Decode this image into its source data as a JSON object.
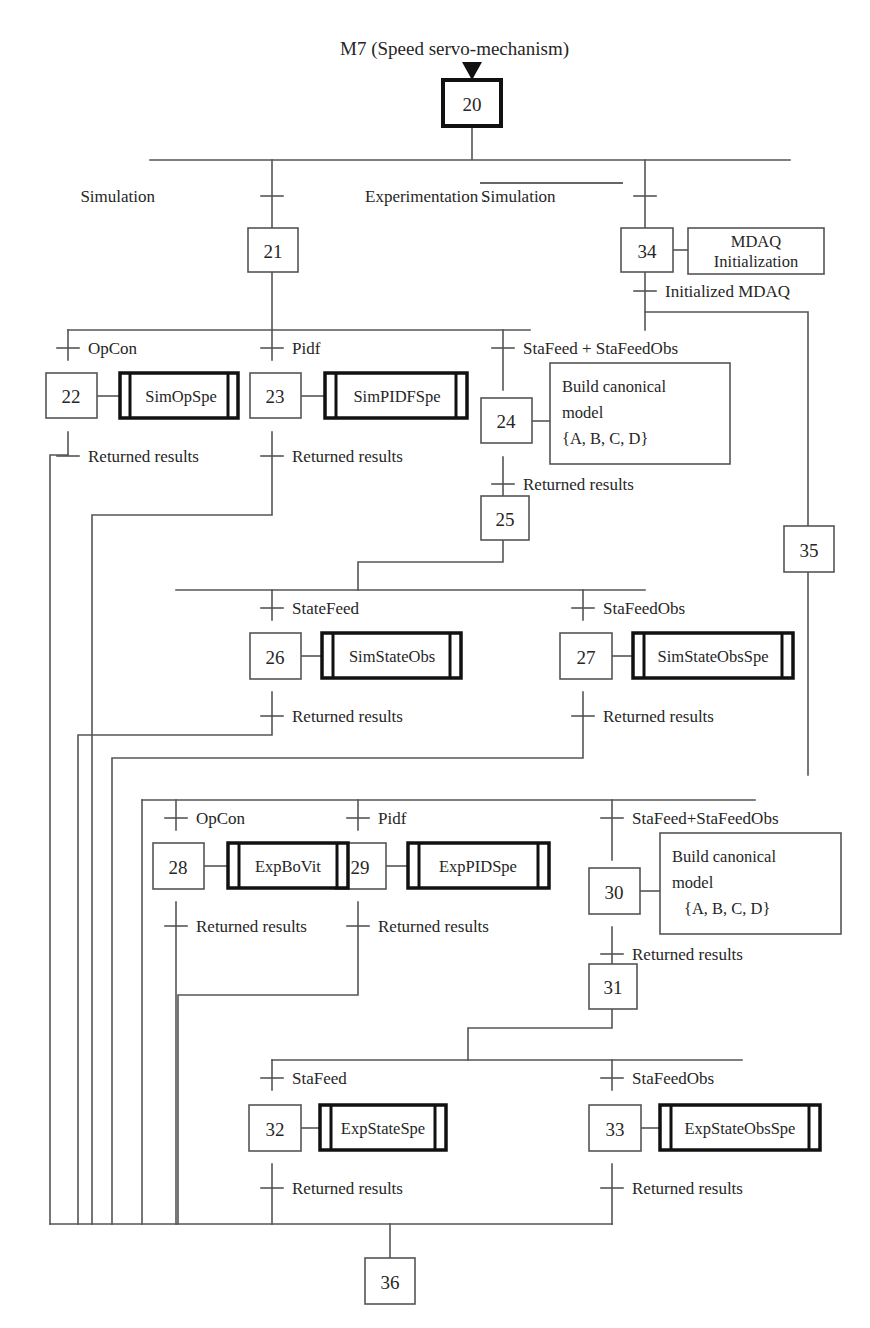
{
  "diagram": {
    "type": "grafcet-sfc",
    "title": "M7 (Speed servo-mechanism)",
    "background": "#ffffff",
    "line_color": "#555555",
    "text_color": "#262626"
  },
  "steps": [
    {
      "id": "20",
      "label": "20",
      "kind": "initial-bold"
    },
    {
      "id": "21",
      "label": "21",
      "kind": "normal"
    },
    {
      "id": "22",
      "label": "22",
      "kind": "normal"
    },
    {
      "id": "23",
      "label": "23",
      "kind": "normal"
    },
    {
      "id": "24",
      "label": "24",
      "kind": "normal"
    },
    {
      "id": "25",
      "label": "25",
      "kind": "normal"
    },
    {
      "id": "26",
      "label": "26",
      "kind": "normal"
    },
    {
      "id": "27",
      "label": "27",
      "kind": "normal"
    },
    {
      "id": "28",
      "label": "28",
      "kind": "normal"
    },
    {
      "id": "29",
      "label": "29",
      "kind": "normal"
    },
    {
      "id": "30",
      "label": "30",
      "kind": "normal"
    },
    {
      "id": "31",
      "label": "31",
      "kind": "normal"
    },
    {
      "id": "32",
      "label": "32",
      "kind": "normal"
    },
    {
      "id": "33",
      "label": "33",
      "kind": "normal"
    },
    {
      "id": "34",
      "label": "34",
      "kind": "normal"
    },
    {
      "id": "35",
      "label": "35",
      "kind": "normal"
    },
    {
      "id": "36",
      "label": "36",
      "kind": "normal"
    }
  ],
  "transitions": [
    {
      "id": "t-simulation",
      "label": "Simulation",
      "overline": false
    },
    {
      "id": "t-experimentation",
      "label": "Experimentation . Simulation",
      "overline": true,
      "overline_part": "Simulation",
      "plain_part": "Experimentation ."
    },
    {
      "id": "t-initialized-mdaq",
      "label": "Initialized MDAQ",
      "overline": false
    },
    {
      "id": "t-opcon-sim",
      "label": "OpCon",
      "overline": false
    },
    {
      "id": "t-pidf-sim",
      "label": "Pidf",
      "overline": false
    },
    {
      "id": "t-stafeed-stafeedobs-sim",
      "label": "StaFeed + StaFeedObs",
      "overline": false
    },
    {
      "id": "t-returned-22",
      "label": "Returned results",
      "overline": false
    },
    {
      "id": "t-returned-23",
      "label": "Returned results",
      "overline": false
    },
    {
      "id": "t-returned-24",
      "label": "Returned results",
      "overline": false
    },
    {
      "id": "t-statefeed-26",
      "label": "StateFeed",
      "overline": false
    },
    {
      "id": "t-stafeedobs-27",
      "label": "StaFeedObs",
      "overline": false
    },
    {
      "id": "t-returned-26",
      "label": "Returned results",
      "overline": false
    },
    {
      "id": "t-returned-27",
      "label": "Returned results",
      "overline": false
    },
    {
      "id": "t-opcon-exp",
      "label": "OpCon",
      "overline": false
    },
    {
      "id": "t-pidf-exp",
      "label": "Pidf",
      "overline": false
    },
    {
      "id": "t-stafeed-stafeedobs-exp",
      "label": "StaFeed+StaFeedObs",
      "overline": false
    },
    {
      "id": "t-returned-28",
      "label": "Returned results",
      "overline": false
    },
    {
      "id": "t-returned-29",
      "label": "Returned results",
      "overline": false
    },
    {
      "id": "t-returned-30",
      "label": "Returned results",
      "overline": false
    },
    {
      "id": "t-stafeed-32",
      "label": "StaFeed",
      "overline": false
    },
    {
      "id": "t-stafeedobs-33",
      "label": "StaFeedObs",
      "overline": false
    },
    {
      "id": "t-returned-32",
      "label": "Returned results",
      "overline": false
    },
    {
      "id": "t-returned-33",
      "label": "Returned results",
      "overline": false
    }
  ],
  "actions": [
    {
      "id": "a-simopspe",
      "label": "SimOpSpe",
      "style": "subroutine",
      "step": "22"
    },
    {
      "id": "a-simpidfspe",
      "label": "SimPIDFSpe",
      "style": "subroutine",
      "step": "23"
    },
    {
      "id": "a-simstateobs",
      "label": "SimStateObs",
      "style": "subroutine",
      "step": "26"
    },
    {
      "id": "a-simstateobsspe",
      "label": "SimStateObsSpe",
      "style": "subroutine",
      "step": "27"
    },
    {
      "id": "a-expbovit",
      "label": "ExpBoVit",
      "style": "subroutine",
      "step": "28"
    },
    {
      "id": "a-exppidspe",
      "label": "ExpPIDSpe",
      "style": "subroutine",
      "step": "29"
    },
    {
      "id": "a-expstatespe",
      "label": "ExpStateSpe",
      "style": "subroutine",
      "step": "32"
    },
    {
      "id": "a-expstateobsspe",
      "label": "ExpStateObsSpe",
      "style": "subroutine",
      "step": "33"
    },
    {
      "id": "a-mdaq-init",
      "label_line1": "MDAQ",
      "label_line2": "Initialization",
      "style": "plain",
      "step": "34"
    },
    {
      "id": "a-build-sim",
      "label_line1": "Build canonical",
      "label_line2": "model",
      "label_line3": "{A, B, C, D}",
      "style": "plain",
      "step": "24"
    },
    {
      "id": "a-build-exp",
      "label_line1": "Build canonical",
      "label_line2": "model",
      "label_line3": "{A, B, C, D}",
      "style": "plain",
      "step": "30"
    }
  ]
}
